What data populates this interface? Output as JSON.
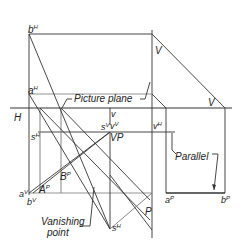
{
  "figure": {
    "labels": {
      "bH": "b",
      "bH_sup": "H",
      "aH": "a",
      "aH_sup": "H",
      "picture_plane": "Picture plane",
      "H": "H",
      "v_top": "v",
      "V_upper": "V",
      "V_right": "V",
      "sH_left": "s",
      "sH_left_sup": "H",
      "sV": "s",
      "sV_sup": "V",
      "vV": "v",
      "vV_sup": "V",
      "VP": "VP",
      "vH": "v",
      "vH_sup": "H",
      "parallel": "Parallel",
      "BP": "B",
      "BP_sup": "P",
      "AP": "A",
      "AP_sup": "P",
      "aV": "a",
      "aV_sup": "V",
      "bV": "b",
      "bV_sup": "V",
      "aP": "a",
      "aP_sup": "P",
      "bP": "b",
      "bP_sup": "P",
      "P": "P",
      "vanishing_point_1": "Vanishing",
      "vanishing_point_2": "point",
      "sH_bottom": "s",
      "sH_bottom_sup": "H"
    },
    "line_color": "#333333"
  }
}
